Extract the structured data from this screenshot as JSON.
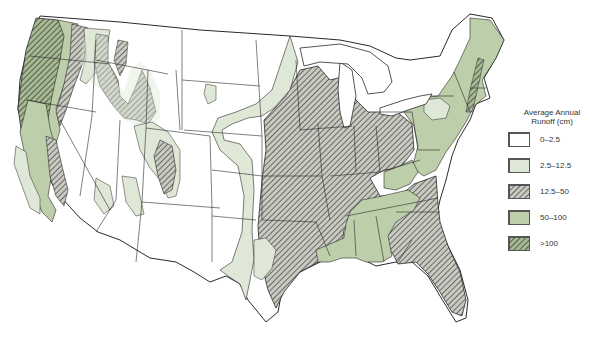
{
  "map": {
    "subject": "Average annual runoff, conterminous United States",
    "colors": {
      "background": "#ffffff",
      "outline": "#2a2a2a",
      "class_0_2_5": "#ffffff",
      "class_2_5_12_5": "#dfe8d6",
      "class_12_5_50_hatch": "#5a5d55",
      "class_12_5_50_base": "#c9cbc3",
      "class_50_100": "#bcceaa",
      "class_gt_100_hatch": "#4d5a44",
      "class_gt_100_base": "#a6b894"
    }
  },
  "legend": {
    "title_line1": "Average Annual",
    "title_line2": "Runoff (cm)",
    "items": [
      {
        "label": "0–2.5",
        "fill": "white"
      },
      {
        "label": "2.5–12.5",
        "fill": "light-green"
      },
      {
        "label": "12.5–50",
        "fill": "gray-hatched"
      },
      {
        "label": "50–100",
        "fill": "medium-green"
      },
      {
        "label": ">100",
        "fill": "green-hatched"
      }
    ]
  }
}
